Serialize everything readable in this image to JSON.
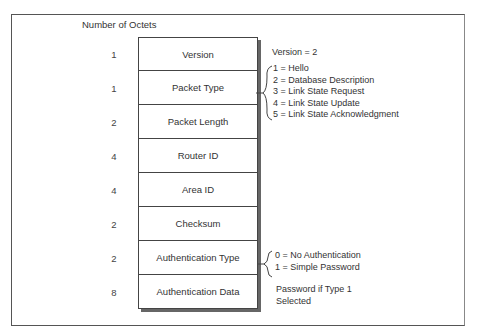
{
  "diagram": {
    "header": "Number of Octets",
    "fields": [
      {
        "name": "Version",
        "octets": "1"
      },
      {
        "name": "Packet Type",
        "octets": "1"
      },
      {
        "name": "Packet Length",
        "octets": "2"
      },
      {
        "name": "Router ID",
        "octets": "4"
      },
      {
        "name": "Area ID",
        "octets": "4"
      },
      {
        "name": "Checksum",
        "octets": "2"
      },
      {
        "name": "Authentication Type",
        "octets": "2"
      },
      {
        "name": "Authentication Data",
        "octets": "8"
      }
    ],
    "notes": {
      "version": "Version = 2",
      "packet_types": [
        "1 = Hello",
        "2 = Database Description",
        "3 = Link State Request",
        "4 = Link State Update",
        "5 = Link State Acknowledgment"
      ],
      "auth_types": [
        "0 = No Authentication",
        "1 = Simple Password"
      ],
      "auth_data_line1": "Password if Type 1",
      "auth_data_line2": "Selected"
    }
  }
}
